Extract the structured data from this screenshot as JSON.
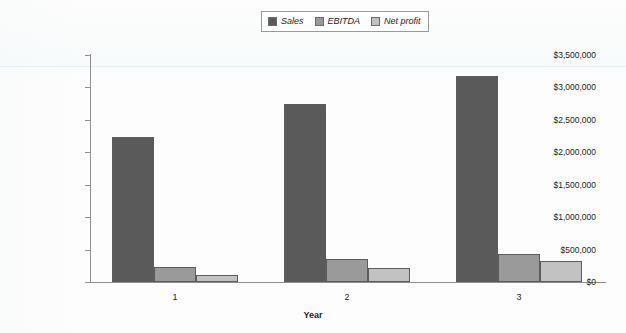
{
  "chart_data": {
    "type": "bar",
    "title": "",
    "subtitle": "",
    "xlabel": "Year",
    "ylabel": "",
    "categories": [
      "1",
      "2",
      "3"
    ],
    "series": [
      {
        "name": "Sales",
        "color": "#5a5a5a",
        "values": [
          2240000,
          2740000,
          3180000
        ]
      },
      {
        "name": "EBITDA",
        "color": "#9a9a9a",
        "values": [
          230000,
          350000,
          430000
        ]
      },
      {
        "name": "Net profit",
        "color": "#c2c2c2",
        "values": [
          115000,
          215000,
          330000
        ]
      }
    ],
    "ylim": [
      0,
      3500000
    ],
    "ytick_values": [
      0,
      500000,
      1000000,
      1500000,
      2000000,
      2500000,
      3000000,
      3500000
    ],
    "ytick_labels": [
      "$0",
      "$500,000",
      "$1,000,000",
      "$1,500,000",
      "$2,000,000",
      "$2,500,000",
      "$3,000,000",
      "$3,500,000"
    ],
    "grid": false,
    "legend_position": "top-center",
    "legend_entries": [
      "Sales",
      "EBITDA",
      "Net profit"
    ]
  },
  "axis": {
    "x_title": "Year"
  },
  "colors": {
    "sales": "#5a5a5a",
    "ebitda": "#9a9a9a",
    "net_profit": "#c2c2c2",
    "axis": "#8e8e8e",
    "text": "#1d1d1d"
  }
}
